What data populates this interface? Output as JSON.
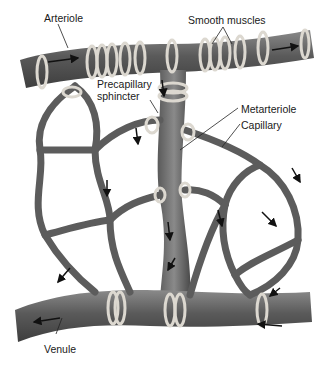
{
  "diagram": {
    "labels": {
      "arteriole": "Arteriole",
      "smooth_muscles": "Smooth muscles",
      "precapillary_sphincter_line1": "Precapillary",
      "precapillary_sphincter_line2": "sphincter",
      "metarteriole": "Metarteriole",
      "capillary": "Capillary",
      "venule": "Venule"
    },
    "colors": {
      "vessel_dark": "#4a4a4a",
      "vessel_mid": "#6e6e6e",
      "vessel_light": "#9a9a9a",
      "muscle_band": "#d9d6cf",
      "arrow": "#111111",
      "background": "#ffffff"
    }
  }
}
